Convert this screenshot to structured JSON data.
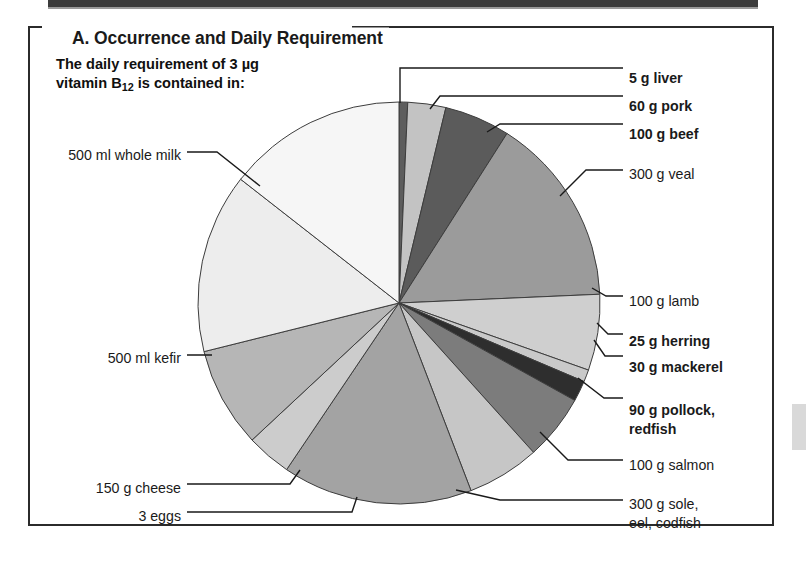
{
  "panel": {
    "title": "A. Occurrence and Daily Requirement",
    "intro_line1": "The daily requirement of 3 µg",
    "intro_line2_pre": "vitamin B",
    "intro_line2_sub": "12",
    "intro_line2_post": " is contained in:"
  },
  "colors": {
    "ink": "#1a1a1a",
    "frame": "#2b2b2b",
    "leader": "#1a1a1a",
    "slice_stroke": "#3d3d3d",
    "top_bar": "#3b3b3b",
    "side_tab": "#d9d9d9"
  },
  "chart_data": {
    "type": "pie",
    "title": "A. Occurrence and Daily Requirement",
    "subtitle": "The daily requirement of 3 µg vitamin B12 is contained in:",
    "unit_note": "Each slice = one food portion supplying 3 µg vitamin B12",
    "start_angle_deg": 0,
    "direction": "clockwise",
    "legend": "leader-labelled",
    "grid": false,
    "categories": [
      "5 g liver",
      "60 g pork",
      "100 g beef",
      "300 g veal",
      "100 g lamb",
      "25 g herring",
      "30 g mackerel",
      "90 g pollock, redfish",
      "100 g salmon",
      "300 g sole, eel, codfish",
      "3 eggs",
      "150 g cheese",
      "500 ml kefir",
      "500 ml whole milk"
    ],
    "values": [
      2.5,
      11,
      19,
      55,
      22,
      3.5,
      6,
      19,
      21,
      55,
      13,
      29,
      52,
      52
    ],
    "value_unit": "degrees",
    "colors": [
      "#5d5d5d",
      "#c3c3c3",
      "#5b5b5b",
      "#9b9b9b",
      "#cfcfcf",
      "#c9c9c9",
      "#2e2e2e",
      "#7c7c7c",
      "#c6c6c6",
      "#a3a3a3",
      "#cccccc",
      "#b6b6b6",
      "#ededed",
      "#f6f6f6"
    ]
  },
  "labels": [
    {
      "key": "liver",
      "text": "5 g liver",
      "bold": true,
      "x": 629,
      "y": 70,
      "align": "left"
    },
    {
      "key": "pork",
      "text": "60 g pork",
      "bold": true,
      "x": 629,
      "y": 98,
      "align": "left"
    },
    {
      "key": "beef",
      "text": "100 g beef",
      "bold": true,
      "x": 629,
      "y": 126,
      "align": "left"
    },
    {
      "key": "veal",
      "text": "300 g veal",
      "bold": false,
      "x": 629,
      "y": 166,
      "align": "left"
    },
    {
      "key": "lamb",
      "text": "100 g lamb",
      "bold": false,
      "x": 629,
      "y": 293,
      "align": "left"
    },
    {
      "key": "herring",
      "text": "25 g herring",
      "bold": true,
      "x": 629,
      "y": 333,
      "align": "left"
    },
    {
      "key": "mackerel",
      "text": "30 g mackerel",
      "bold": true,
      "x": 629,
      "y": 359,
      "align": "left"
    },
    {
      "key": "pollock-1",
      "text": "90 g pollock,",
      "bold": true,
      "x": 629,
      "y": 402,
      "align": "left"
    },
    {
      "key": "pollock-2",
      "text": "redfish",
      "bold": true,
      "x": 629,
      "y": 421,
      "align": "left"
    },
    {
      "key": "salmon",
      "text": "100 g salmon",
      "bold": false,
      "x": 629,
      "y": 457,
      "align": "left"
    },
    {
      "key": "sole-1",
      "text": "300 g sole,",
      "bold": false,
      "x": 629,
      "y": 496,
      "align": "left"
    },
    {
      "key": "sole-2",
      "text": "eel, codfish",
      "bold": false,
      "x": 629,
      "y": 515,
      "align": "left"
    },
    {
      "key": "whole-milk",
      "text": "500 ml whole milk",
      "bold": false,
      "x": 181,
      "y": 147,
      "align": "right"
    },
    {
      "key": "kefir",
      "text": "500 ml kefir",
      "bold": false,
      "x": 181,
      "y": 350,
      "align": "right"
    },
    {
      "key": "cheese",
      "text": "150 g cheese",
      "bold": false,
      "x": 181,
      "y": 480,
      "align": "right"
    },
    {
      "key": "eggs",
      "text": "3 eggs",
      "bold": false,
      "x": 181,
      "y": 508,
      "align": "right"
    }
  ],
  "leaders": [
    {
      "key": "liver",
      "points": "400,103 400,68 623,68"
    },
    {
      "key": "pork",
      "points": "430,109 440,96 623,96"
    },
    {
      "key": "beef",
      "points": "487,132 500,124 623,124"
    },
    {
      "key": "veal",
      "points": "560,196 586,170 623,170"
    },
    {
      "key": "lamb",
      "points": "592,288 606,296 623,296"
    },
    {
      "key": "herring",
      "points": "597,323 608,334 623,334"
    },
    {
      "key": "mackerel",
      "points": "594,340 605,356 623,356"
    },
    {
      "key": "pollock",
      "points": "578,378 604,398 623,398"
    },
    {
      "key": "salmon",
      "points": "540,432 568,460 623,460"
    },
    {
      "key": "sole",
      "points": "456,490 500,500 623,500"
    },
    {
      "key": "whole-milk",
      "points": "260,186 217,152 187,152"
    },
    {
      "key": "kefir",
      "points": "205,355 212,355 187,355"
    },
    {
      "key": "cheese",
      "points": "300,470 290,484 187,484"
    },
    {
      "key": "eggs",
      "points": "357,497 352,512 187,512"
    }
  ],
  "geometry": {
    "cx": 399,
    "cy": 303,
    "r": 201
  }
}
